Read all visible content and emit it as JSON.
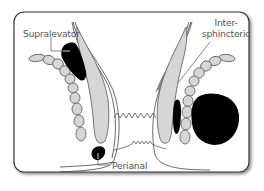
{
  "diagram": {
    "labels": {
      "supralevator": "Supralevator",
      "intersphincteric_line1": "Inter-",
      "intersphincteric_line2": "sphincteric",
      "perianal": "Perianal"
    },
    "colors": {
      "frame": "#333333",
      "abscess": "#000000",
      "muscle_fill": "#d6d6d6",
      "muscle_stroke": "#555555",
      "label_text": "#555555",
      "background": "#ffffff"
    }
  }
}
